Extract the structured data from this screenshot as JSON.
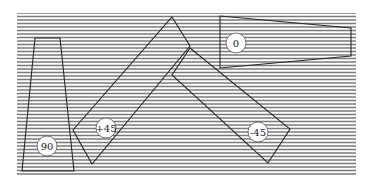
{
  "figure": {
    "background": {
      "x": 17,
      "y": 13,
      "width": 339,
      "height": 162,
      "line_spacing": 3.5,
      "line_color": "#7a7a7a",
      "fill": "#ffffff"
    },
    "stroke_color": "#2a2a2a",
    "shapes": [
      {
        "id": "shape-90",
        "label": "90",
        "points": "35,38 60,38 74,171 22,171",
        "label_pos": [
          47,
          146
        ]
      },
      {
        "id": "shape-plus45",
        "label": "+45",
        "points": "172,17 190,46 92,164 73,130",
        "label_pos": [
          106,
          128
        ]
      },
      {
        "id": "shape-minus45",
        "label": "-45",
        "points": "190,48 290,129 268,163 172,75",
        "label_pos": [
          258,
          132
        ]
      },
      {
        "id": "shape-0",
        "label": "0",
        "points": "220,16 351,28 351,56 220,68",
        "label_pos": [
          236,
          43
        ]
      }
    ]
  }
}
